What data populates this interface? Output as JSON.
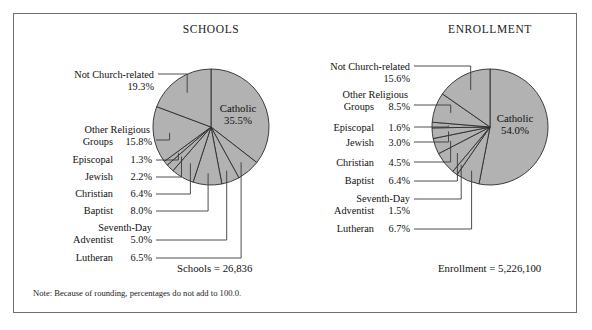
{
  "figure": {
    "note": "Note: Because of rounding, percentages do not add to 100.0.",
    "fill_color": "#b2b2b2",
    "stroke_color": "#2b2b2b",
    "frame_color": "#6f6f6f"
  },
  "chart_data": [
    {
      "type": "pie",
      "title": "SCHOOLS",
      "total_label": "Schools  =  26,836",
      "total_value": 26836,
      "center_label": "Catholic",
      "center_value": "35.5%",
      "categories": [
        "Catholic",
        "Lutheran",
        "Seventh-Day Adventist",
        "Baptist",
        "Christian",
        "Jewish",
        "Episcopal",
        "Other Religious Groups",
        "Not Church-related"
      ],
      "values": [
        35.5,
        6.5,
        5.0,
        8.0,
        6.4,
        2.2,
        1.3,
        15.8,
        19.3
      ],
      "labels": [
        {
          "name": "Not  Church-related",
          "pct": "19.3%",
          "two_line": false
        },
        {
          "name": "Other  Religious",
          "name2": "Groups",
          "pct": "15.8%",
          "two_line": true
        },
        {
          "name": "Episcopal",
          "pct": "1.3%",
          "two_line": false
        },
        {
          "name": "Jewish",
          "pct": "2.2%",
          "two_line": false
        },
        {
          "name": "Christian",
          "pct": "6.4%",
          "two_line": false
        },
        {
          "name": "Baptist",
          "pct": "8.0%",
          "two_line": false
        },
        {
          "name": "Seventh-Day",
          "name2": "Adventist",
          "pct": "5.0%",
          "two_line": true
        },
        {
          "name": "Lutheran",
          "pct": "6.5%",
          "two_line": false
        }
      ]
    },
    {
      "type": "pie",
      "title": "ENROLLMENT",
      "total_label": "Enrollment  =  5,226,100",
      "total_value": 5226100,
      "center_label": "Catholic",
      "center_value": "54.0%",
      "categories": [
        "Catholic",
        "Lutheran",
        "Seventh-Day Adventist",
        "Baptist",
        "Christian",
        "Jewish",
        "Episcopal",
        "Other Religious Groups",
        "Not Church-related"
      ],
      "values": [
        54.0,
        6.7,
        1.5,
        6.4,
        4.5,
        3.0,
        1.6,
        8.5,
        15.6
      ],
      "labels": [
        {
          "name": "Not  Church-related",
          "pct": "15.6%",
          "two_line": false
        },
        {
          "name": "Other  Religious",
          "name2": "Groups",
          "pct": "8.5%",
          "two_line": true
        },
        {
          "name": "Episcopal",
          "pct": "1.6%",
          "two_line": false
        },
        {
          "name": "Jewish",
          "pct": "3.0%",
          "two_line": false
        },
        {
          "name": "Christian",
          "pct": "4.5%",
          "two_line": false
        },
        {
          "name": "Baptist",
          "pct": "6.4%",
          "two_line": false
        },
        {
          "name": "Seventh-Day",
          "name2": "Adventist",
          "pct": "1.5%",
          "two_line": true
        },
        {
          "name": "Lutheran",
          "pct": "6.7%",
          "two_line": false
        }
      ]
    }
  ]
}
